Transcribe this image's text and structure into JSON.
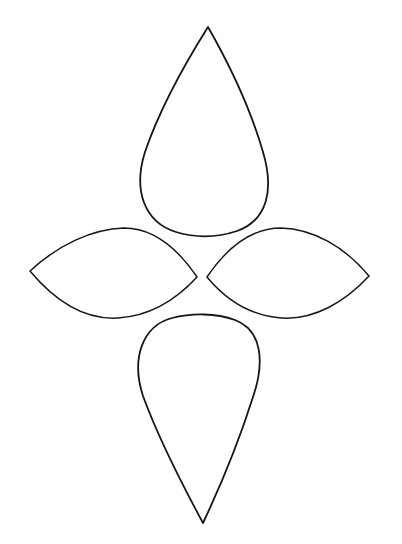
{
  "document": {
    "title": "Four Petal Flower Template",
    "type": "line-drawing",
    "background_color": "#ffffff",
    "stroke_color": "#161616",
    "canvas": {
      "width": 402,
      "height": 544
    }
  },
  "drawing": {
    "subject": "four-petal flower outline template",
    "center": {
      "x": 203,
      "y": 276
    },
    "petal_count": 4,
    "petals": [
      {
        "id": "petal-top",
        "name": "top-petal",
        "shape": "teardrop",
        "orientation": "up",
        "tip": {
          "x": 208,
          "y": 27
        },
        "bounds": {
          "left": 141,
          "top": 27,
          "right": 266,
          "bottom": 234
        },
        "widest_y": 175,
        "path": "M 208 27 C 186 62, 160 108, 145 152 C 133 190, 144 222, 176 232 C 196 238, 216 238, 237 231 C 268 220, 274 189, 263 152 C 250 107, 228 62, 208 27 Z"
      },
      {
        "id": "petal-left",
        "name": "left-petal",
        "shape": "pointed-oval",
        "orientation": "left",
        "outer_tip": {
          "x": 30,
          "y": 271
        },
        "inner_tip": {
          "x": 197,
          "y": 277
        },
        "bounds": {
          "left": 30,
          "top": 228,
          "right": 197,
          "bottom": 319
        },
        "path": "M 30 271 C 58 245, 92 229, 124 228 C 155 228, 178 249, 197 277 C 176 300, 149 316, 118 318 C 85 320, 55 301, 30 271 Z"
      },
      {
        "id": "petal-right",
        "name": "right-petal",
        "shape": "pointed-oval",
        "orientation": "right",
        "inner_tip": {
          "x": 207,
          "y": 277
        },
        "outer_tip": {
          "x": 369,
          "y": 276
        },
        "bounds": {
          "left": 207,
          "top": 228,
          "right": 369,
          "bottom": 319
        },
        "path": "M 207 277 C 226 249, 250 228, 281 228 C 313 229, 344 246, 369 276 C 345 302, 314 320, 282 318 C 251 316, 226 300, 207 277 Z"
      },
      {
        "id": "petal-bottom",
        "name": "bottom-petal",
        "shape": "teardrop",
        "orientation": "down",
        "tip": {
          "x": 203,
          "y": 523
        },
        "bounds": {
          "left": 135,
          "top": 316,
          "right": 253,
          "bottom": 523
        },
        "widest_y": 388,
        "path": "M 203 523 C 183 486, 158 437, 143 396 C 131 359, 142 326, 172 318 C 192 313, 216 313, 235 320 C 262 330, 265 362, 253 397 C 240 438, 220 487, 203 523 Z"
      }
    ]
  }
}
